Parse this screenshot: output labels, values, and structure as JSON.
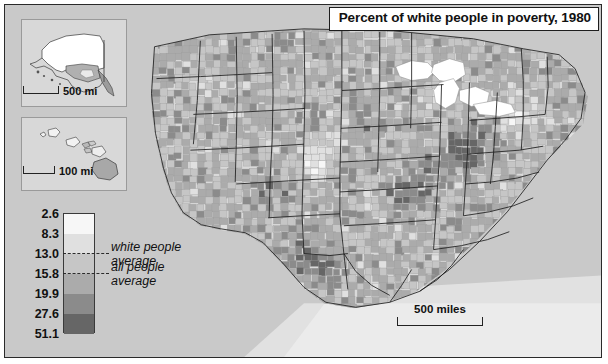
{
  "title": {
    "text": "Percent of white people in poverty, 1980"
  },
  "map": {
    "name": "united-states-county-choropleth",
    "background_color": "#c9c9c9",
    "border_color": "#2a2a2a",
    "state_border_color": "#1f1f1f",
    "county_border_color": "#8d8d8d",
    "water_color": "#ffffff",
    "scalebar": {
      "label": "500 miles"
    }
  },
  "insets": [
    {
      "name": "alaska",
      "scalebar_label": "500 mi"
    },
    {
      "name": "hawaii",
      "scalebar_label": "100 mi"
    }
  ],
  "legend": {
    "name": "poverty-percent-legend",
    "breaks": [
      "2.6",
      "8.3",
      "13.0",
      "15.8",
      "19.9",
      "27.6",
      "51.1"
    ],
    "colors": [
      "#f7f7f7",
      "#e0e0e0",
      "#c6c6c6",
      "#ababab",
      "#8b8b8b",
      "#666666",
      "#4a4a4a"
    ],
    "annotations": [
      {
        "name": "white-people-average",
        "line1": "white people",
        "line2": "average",
        "value": "13.0"
      },
      {
        "name": "all-people-average",
        "line1": "all people",
        "line2": "average",
        "value": "15.8"
      }
    ]
  },
  "chart_data": {
    "type": "heatmap",
    "title": "Percent of white people in poverty, 1980",
    "subtitle": "",
    "xlabel": "",
    "ylabel": "",
    "legend_position": "bottom-left",
    "grid": false,
    "classification": "graduated choropleth, 6 classes",
    "unit": "percent of white population below poverty line",
    "class_breaks": [
      2.6,
      8.3,
      13.0,
      15.8,
      19.9,
      27.6,
      51.1
    ],
    "class_colors": [
      "#f7f7f7",
      "#e0e0e0",
      "#c6c6c6",
      "#ababab",
      "#8b8b8b",
      "#666666",
      "#4a4a4a"
    ],
    "reference_values": [
      {
        "label": "white people average",
        "value": 13.0
      },
      {
        "label": "all people average",
        "value": 15.8
      }
    ],
    "spatial_units": "US counties",
    "insets": [
      "Alaska",
      "Hawaii"
    ],
    "scale_bars": [
      "500 miles",
      "500 mi",
      "100 mi"
    ]
  }
}
